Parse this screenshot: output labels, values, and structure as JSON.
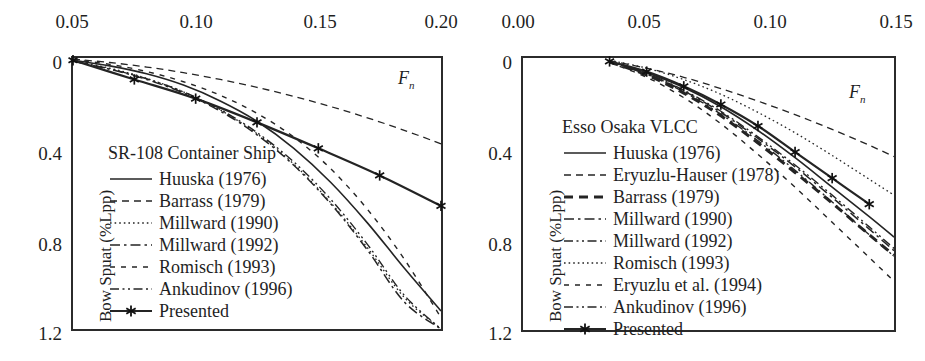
{
  "figure": {
    "width": 925,
    "height": 361,
    "background": "#ffffff",
    "ink_color": "#1f1f1f"
  },
  "chart_data": [
    {
      "id": "left",
      "type": "line",
      "title": "SR-108 Container Ship",
      "xlabel": "Fn",
      "ylabel": "Bow Spuat (%Lpp)",
      "xlim": [
        0.05,
        0.2
      ],
      "ylim": [
        0.0,
        1.2
      ],
      "x_ticks": [
        0.05,
        0.1,
        0.15,
        0.2
      ],
      "x_tick_labels": [
        "0.05",
        "0.10",
        "0.15",
        "0.20"
      ],
      "y_ticks": [
        0,
        0.4,
        0.8,
        1.2
      ],
      "y_tick_labels": [
        "0",
        "0.4",
        "0.8",
        "1.2"
      ],
      "x_axis_position": "top",
      "y_axis_inverted": true,
      "grid": false,
      "legend_position": "inside-left",
      "series": [
        {
          "name": "Huuska (1976)",
          "style": "solid",
          "x": [
            0.05,
            0.065,
            0.08,
            0.095,
            0.11,
            0.125,
            0.14,
            0.155,
            0.17,
            0.185,
            0.2
          ],
          "y": [
            0.01,
            0.035,
            0.07,
            0.12,
            0.19,
            0.28,
            0.4,
            0.55,
            0.73,
            0.93,
            1.12
          ]
        },
        {
          "name": "Barrass (1979)",
          "style": "dashed",
          "x": [
            0.05,
            0.065,
            0.08,
            0.095,
            0.11,
            0.125,
            0.14,
            0.155,
            0.17,
            0.185,
            0.2
          ],
          "y": [
            0.005,
            0.02,
            0.04,
            0.065,
            0.095,
            0.13,
            0.17,
            0.215,
            0.265,
            0.32,
            0.38
          ]
        },
        {
          "name": "Millward (1990)",
          "style": "dotted",
          "x": [
            0.05,
            0.065,
            0.08,
            0.095,
            0.11,
            0.125,
            0.14,
            0.155,
            0.17,
            0.185,
            0.2
          ],
          "y": [
            0.012,
            0.045,
            0.09,
            0.15,
            0.23,
            0.335,
            0.47,
            0.64,
            0.84,
            1.06,
            1.2
          ]
        },
        {
          "name": "Millward (1992)",
          "style": "dashdot",
          "x": [
            0.05,
            0.065,
            0.08,
            0.095,
            0.11,
            0.125,
            0.14,
            0.155,
            0.17,
            0.185,
            0.2
          ],
          "y": [
            0.015,
            0.05,
            0.095,
            0.155,
            0.235,
            0.34,
            0.475,
            0.645,
            0.85,
            1.08,
            1.2
          ]
        },
        {
          "name": "Romisch (1993)",
          "style": "longdash",
          "x": [
            0.05,
            0.065,
            0.08,
            0.095,
            0.11,
            0.125,
            0.14,
            0.155,
            0.17,
            0.185,
            0.2
          ],
          "y": [
            0.008,
            0.028,
            0.06,
            0.105,
            0.165,
            0.245,
            0.35,
            0.49,
            0.67,
            0.89,
            1.15
          ]
        },
        {
          "name": "Ankudinov (1996)",
          "style": "dashdotdot",
          "x": [
            0.05,
            0.065,
            0.08,
            0.095,
            0.11,
            0.125,
            0.14,
            0.155,
            0.17,
            0.185,
            0.2
          ],
          "y": [
            0.014,
            0.048,
            0.092,
            0.15,
            0.228,
            0.33,
            0.46,
            0.625,
            0.825,
            1.05,
            1.2
          ]
        },
        {
          "name": "Presented",
          "style": "solid-marker",
          "marker": "asterisk",
          "x": [
            0.05,
            0.075,
            0.1,
            0.125,
            0.15,
            0.175,
            0.2
          ],
          "y": [
            0.01,
            0.095,
            0.18,
            0.285,
            0.4,
            0.52,
            0.655
          ]
        }
      ]
    },
    {
      "id": "right",
      "type": "line",
      "title": "Esso Osaka VLCC",
      "xlabel": "Fn",
      "ylabel": "Bow Spuat (%Lpp)",
      "xlim": [
        0.0,
        0.15
      ],
      "ylim": [
        0.0,
        1.2
      ],
      "x_ticks": [
        0.0,
        0.05,
        0.1,
        0.15
      ],
      "x_tick_labels": [
        "0.00",
        "0.05",
        "0.10",
        "0.15"
      ],
      "y_ticks": [
        0,
        0.4,
        0.8,
        1.2
      ],
      "y_tick_labels": [
        "0",
        "0.4",
        "0.8",
        "1.2"
      ],
      "x_axis_position": "top",
      "y_axis_inverted": true,
      "grid": false,
      "legend_position": "inside-left",
      "series": [
        {
          "name": "Huuska (1976)",
          "style": "solid",
          "x": [
            0.035,
            0.05,
            0.065,
            0.08,
            0.095,
            0.11,
            0.125,
            0.14,
            0.15
          ],
          "y": [
            0.015,
            0.065,
            0.13,
            0.215,
            0.32,
            0.44,
            0.57,
            0.7,
            0.79
          ]
        },
        {
          "name": "Eryuzlu-Hauser (1978)",
          "style": "dashed",
          "x": [
            0.035,
            0.05,
            0.065,
            0.08,
            0.095,
            0.11,
            0.125,
            0.14,
            0.15
          ],
          "y": [
            0.012,
            0.045,
            0.085,
            0.135,
            0.19,
            0.25,
            0.315,
            0.385,
            0.435
          ]
        },
        {
          "name": "Barrass (1979)",
          "style": "bold-dashed",
          "x": [
            0.035,
            0.05,
            0.065,
            0.08,
            0.095,
            0.11,
            0.125,
            0.14,
            0.15
          ],
          "y": [
            0.018,
            0.075,
            0.155,
            0.255,
            0.375,
            0.505,
            0.64,
            0.78,
            0.87
          ]
        },
        {
          "name": "Millward (1990)",
          "style": "dashdot",
          "x": [
            0.035,
            0.05,
            0.065,
            0.08,
            0.095,
            0.11,
            0.125,
            0.14,
            0.15
          ],
          "y": [
            0.016,
            0.07,
            0.145,
            0.24,
            0.355,
            0.48,
            0.615,
            0.755,
            0.85
          ]
        },
        {
          "name": "Millward (1992)",
          "style": "dashdotdot",
          "x": [
            0.035,
            0.05,
            0.065,
            0.08,
            0.095,
            0.11,
            0.125,
            0.14,
            0.15
          ],
          "y": [
            0.017,
            0.072,
            0.15,
            0.248,
            0.365,
            0.495,
            0.635,
            0.78,
            0.875
          ]
        },
        {
          "name": "Romisch (1993)",
          "style": "dotted",
          "x": [
            0.035,
            0.05,
            0.065,
            0.08,
            0.095,
            0.11,
            0.125,
            0.14,
            0.15
          ],
          "y": [
            0.01,
            0.045,
            0.095,
            0.16,
            0.24,
            0.33,
            0.43,
            0.535,
            0.605
          ]
        },
        {
          "name": "Eryuzlu et al. (1994)",
          "style": "longdash",
          "x": [
            0.035,
            0.05,
            0.065,
            0.08,
            0.095,
            0.11,
            0.125,
            0.14,
            0.15
          ],
          "y": [
            0.02,
            0.085,
            0.175,
            0.29,
            0.425,
            0.57,
            0.725,
            0.88,
            0.985
          ]
        },
        {
          "name": "Ankudinov (1996)",
          "style": "dashdotdot",
          "x": [
            0.035,
            0.05,
            0.065,
            0.08,
            0.095,
            0.11,
            0.125,
            0.14,
            0.15
          ],
          "y": [
            0.016,
            0.068,
            0.142,
            0.235,
            0.348,
            0.472,
            0.605,
            0.745,
            0.84
          ]
        },
        {
          "name": "Presented",
          "style": "solid-marker",
          "marker": "asterisk",
          "x": [
            0.035,
            0.05,
            0.065,
            0.08,
            0.095,
            0.11,
            0.125,
            0.14
          ],
          "y": [
            0.015,
            0.06,
            0.125,
            0.205,
            0.3,
            0.415,
            0.53,
            0.645
          ]
        }
      ]
    }
  ],
  "left_chart": {
    "title": "SR-108 Container Ship",
    "fn_label": "F",
    "fn_sub": "n",
    "ylabel": "Bow Spuat (%Lpp)",
    "x_tick_labels": [
      "0.05",
      "0.10",
      "0.15",
      "0.20"
    ],
    "y_tick_labels": [
      "0",
      "0.4",
      "0.8",
      "1.2"
    ],
    "legend": [
      {
        "label": "Huuska (1976)",
        "key": "solid"
      },
      {
        "label": "Barrass (1979)",
        "key": "dashed"
      },
      {
        "label": "Millward (1990)",
        "key": "dotted"
      },
      {
        "label": "Millward (1992)",
        "key": "dashdot"
      },
      {
        "label": "Romisch (1993)",
        "key": "longdash"
      },
      {
        "label": "Ankudinov (1996)",
        "key": "dashdotdot"
      },
      {
        "label": "Presented",
        "key": "marker"
      }
    ]
  },
  "right_chart": {
    "title": "Esso Osaka VLCC",
    "fn_label": "F",
    "fn_sub": "n",
    "ylabel": "Bow Spuat (%Lpp)",
    "x_tick_labels": [
      "0.00",
      "0.05",
      "0.10",
      "0.15"
    ],
    "y_tick_labels": [
      "0",
      "0.4",
      "0.8",
      "1.2"
    ],
    "legend": [
      {
        "label": "Huuska (1976)",
        "key": "solid"
      },
      {
        "label": "Eryuzlu-Hauser (1978)",
        "key": "dashed"
      },
      {
        "label": "Barrass (1979)",
        "key": "bold-dashed"
      },
      {
        "label": "Millward (1990)",
        "key": "dashdot"
      },
      {
        "label": "Millward (1992)",
        "key": "dashdotdot"
      },
      {
        "label": "Romisch (1993)",
        "key": "dotted"
      },
      {
        "label": "Eryuzlu et al. (1994)",
        "key": "longdash"
      },
      {
        "label": "Ankudinov (1996)",
        "key": "dashdotdot"
      },
      {
        "label": "Presented",
        "key": "marker"
      }
    ]
  }
}
